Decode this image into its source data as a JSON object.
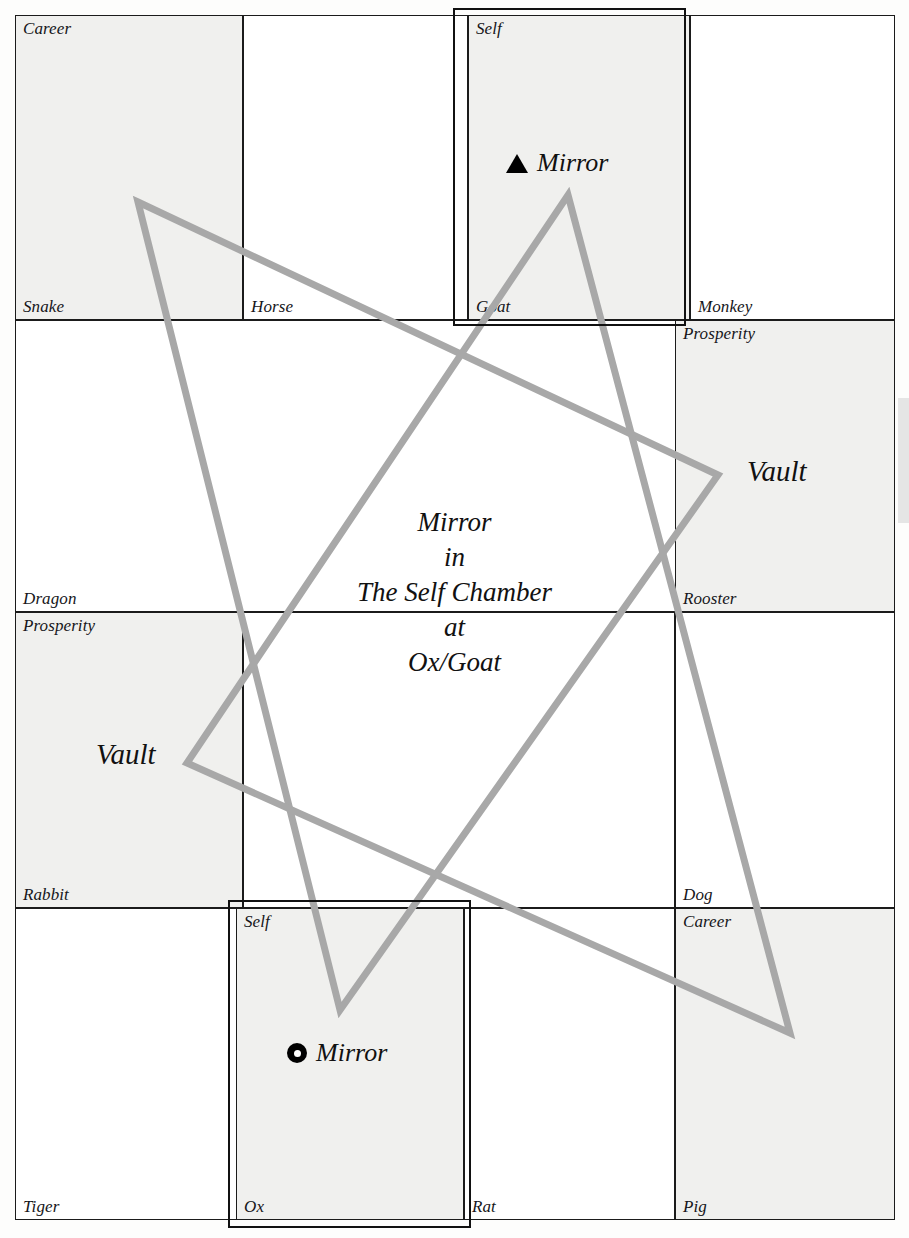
{
  "diagram": {
    "title": "Mirror in The Self Chamber at Ox/Goat",
    "center_caption": {
      "line1": "Mirror",
      "line2": "in",
      "line3": "The Self Chamber",
      "line4": "at",
      "line5": "Ox/Goat"
    },
    "colors": {
      "grid_line": "#1b1b1b",
      "shaded_cell": "#f0f0ee",
      "plain_cell": "#ffffff",
      "triangle_stroke": "#a8a8a8",
      "marker": "#000000"
    },
    "cells": [
      {
        "id": "career-snake",
        "top_label": "Career",
        "bottom_label": "Snake",
        "shaded": true
      },
      {
        "id": "horse",
        "top_label": "",
        "bottom_label": "Horse",
        "shaded": false
      },
      {
        "id": "self-goat",
        "top_label": "Self",
        "bottom_label": "Goat",
        "shaded": true
      },
      {
        "id": "monkey",
        "top_label": "",
        "bottom_label": "Monkey",
        "shaded": false
      },
      {
        "id": "dragon",
        "top_label": "",
        "bottom_label": "Dragon",
        "shaded": false
      },
      {
        "id": "prosperity-rooster",
        "top_label": "Prosperity",
        "bottom_label": "Rooster",
        "shaded": true
      },
      {
        "id": "prosperity-rabbit",
        "top_label": "Prosperity",
        "bottom_label": "Rabbit",
        "shaded": true
      },
      {
        "id": "dog",
        "top_label": "",
        "bottom_label": "Dog",
        "shaded": false
      },
      {
        "id": "tiger",
        "top_label": "",
        "bottom_label": "Tiger",
        "shaded": false
      },
      {
        "id": "self-ox",
        "top_label": "Self",
        "bottom_label": "Ox",
        "shaded": true
      },
      {
        "id": "rat",
        "top_label": "",
        "bottom_label": "Rat",
        "shaded": false
      },
      {
        "id": "career-pig",
        "top_label": "Career",
        "bottom_label": "Pig",
        "shaded": true
      }
    ],
    "markers": [
      {
        "id": "mirror-goat",
        "glyph": "filled-triangle-icon",
        "label": "Mirror"
      },
      {
        "id": "mirror-ox",
        "glyph": "ring-dot-icon",
        "label": "Mirror"
      }
    ],
    "vaults": [
      {
        "id": "vault-right",
        "label": "Vault"
      },
      {
        "id": "vault-left",
        "label": "Vault"
      }
    ],
    "labels": {
      "career": "Career",
      "snake": "Snake",
      "horse": "Horse",
      "self": "Self",
      "goat": "Goat",
      "monkey": "Monkey",
      "prosperity": "Prosperity",
      "dragon": "Dragon",
      "rooster": "Rooster",
      "rabbit": "Rabbit",
      "dog": "Dog",
      "tiger": "Tiger",
      "ox": "Ox",
      "rat": "Rat",
      "pig": "Pig",
      "vault": "Vault",
      "mirror": "Mirror"
    }
  },
  "chart_data": {
    "type": "diagram",
    "title": "Mirror in The Self Chamber at Ox/Goat",
    "grid": {
      "columns_px": [
        15,
        243,
        468,
        690,
        895
      ],
      "rows_px": [
        15,
        320,
        612,
        908,
        1220
      ],
      "column_count": 4,
      "row_count": 4
    },
    "triangles": [
      {
        "name": "triangle-A",
        "vertices": [
          [
            138,
            202
          ],
          [
            718,
            475
          ],
          [
            340,
            1010
          ]
        ],
        "stroke": "#a8a8a8",
        "stroke_width": 7
      },
      {
        "name": "triangle-B",
        "vertices": [
          [
            568,
            195
          ],
          [
            790,
            1033
          ],
          [
            187,
            763
          ]
        ],
        "stroke": "#a8a8a8",
        "stroke_width": 7
      }
    ],
    "highlight_boxes": [
      {
        "name": "self-goat-highlight",
        "rect_px": [
          453,
          8,
          233,
          318
        ]
      },
      {
        "name": "self-ox-highlight",
        "rect_px": [
          228,
          900,
          243,
          328
        ]
      }
    ]
  }
}
